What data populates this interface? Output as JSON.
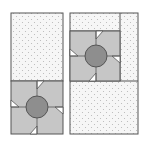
{
  "diagram": {
    "colors": {
      "background": "#ffffff",
      "outline": "#555555",
      "dotted_fabric": "#f4f4f4",
      "dot": "#b8b8b8",
      "pinwheel": "#c6c6c6",
      "circle": "#8e8e8e",
      "gap": "#ffffff"
    },
    "panels": [
      {
        "name": "left-panel",
        "block_position": "bottom"
      },
      {
        "name": "right-panel",
        "block_position": "top-left"
      }
    ]
  }
}
